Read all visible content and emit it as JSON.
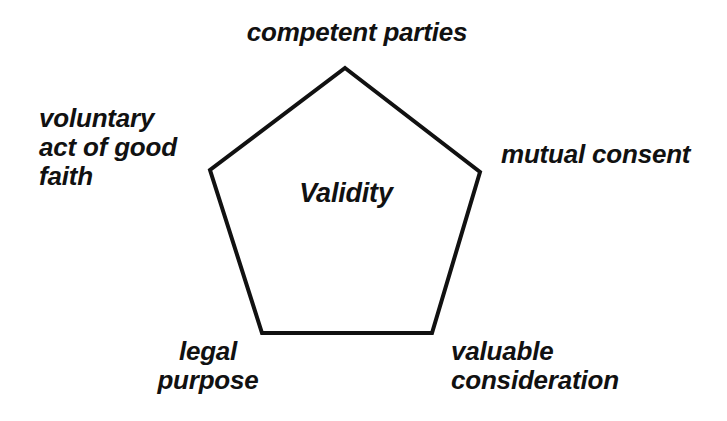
{
  "diagram": {
    "type": "pentagon-concept-diagram",
    "background_color": "#ffffff",
    "stroke_color": "#111111",
    "text_color": "#111111",
    "center_label": "Validity",
    "vertices_labels": [
      {
        "id": "top",
        "text": "competent parties",
        "position": "top"
      },
      {
        "id": "right",
        "text": "mutual consent",
        "position": "right"
      },
      {
        "id": "bottom-right",
        "text": "valuable\nconsideration",
        "position": "bottom-right"
      },
      {
        "id": "bottom-left",
        "text": "legal\npurpose",
        "position": "bottom-left"
      },
      {
        "id": "left",
        "text": "voluntary\nact of good\nfaith",
        "position": "left"
      }
    ],
    "shape": {
      "name": "pentagon",
      "points": "345,68 480,172 432,333 262,333 210,170",
      "stroke_width": 4
    }
  }
}
